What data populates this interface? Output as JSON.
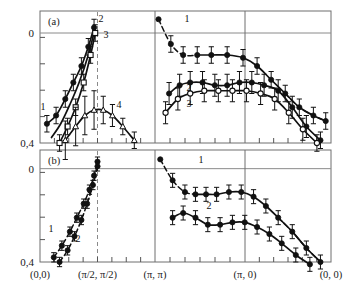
{
  "figure": {
    "panels": [
      {
        "tag": "(a)"
      },
      {
        "tag": "(b)"
      }
    ],
    "y_axis": {
      "top_label": "0",
      "bottom_label": "0,4",
      "range_top": 0,
      "range_bottom": -0.4,
      "minor_ticks": 4
    },
    "x_axis": {
      "tick_labels": [
        "(0,0)",
        "(π/2, π/2)",
        "(π, π)",
        "(π, 0)",
        "(0, 0)"
      ],
      "segment_dividers": [
        "(π, π)",
        "(π, 0)"
      ],
      "dashed_marker": "(π/2, π/2)"
    },
    "curve_labels_panel_a": [
      "1",
      "2",
      "3",
      "4",
      "1",
      "2",
      "3"
    ],
    "curve_labels_panel_b": [
      "1",
      "2",
      "1",
      "2"
    ]
  },
  "chart_data": {
    "type": "line",
    "title": "",
    "xlabel": "",
    "ylabel": "",
    "ylim": [
      -0.4,
      0.08
    ],
    "grid": false,
    "legend_position": "inline-curve-labels",
    "axis_notes": {
      "y_tick_labels": [
        "0",
        "0,4"
      ],
      "y_zero_gridline": true,
      "x_tick_labels": [
        "(0,0)",
        "(π/2, π/2)",
        "(π, π)",
        "(π, 0)",
        "(0, 0)"
      ],
      "x_panel_breaks_at": [
        "(π, π)",
        "(π, 0)"
      ],
      "vertical_dashed_line_at": "(π/2, π/2)"
    },
    "panel_a": {
      "tag": "(a)",
      "segment_1_nodal": {
        "x_label_from": "(0,0)",
        "x_label_to": "(π, π)",
        "series": [
          {
            "name": "1",
            "marker": "filled-circle",
            "line": "solid",
            "x": [
              0.06,
              0.14,
              0.22,
              0.29,
              0.36,
              0.42,
              0.47
            ],
            "y": [
              -0.33,
              -0.3,
              -0.24,
              -0.18,
              -0.12,
              -0.05,
              0.02
            ],
            "yerr": [
              0.03,
              0.03,
              0.03,
              0.03,
              0.03,
              0.03,
              0.03
            ]
          },
          {
            "name": "2",
            "marker": "none",
            "line": "solid",
            "x": [
              0.1,
              0.18,
              0.26,
              0.34,
              0.42,
              0.48
            ],
            "y": [
              -0.38,
              -0.33,
              -0.26,
              -0.18,
              -0.08,
              0.02
            ]
          },
          {
            "name": "3",
            "marker": "open-square",
            "line": "solid",
            "x": [
              0.17,
              0.24,
              0.31,
              0.38,
              0.44,
              0.48
            ],
            "y": [
              -0.4,
              -0.34,
              -0.27,
              -0.18,
              -0.08,
              0.0
            ],
            "yerr": [
              0.03,
              0.03,
              0.03,
              0.03,
              0.03,
              0.03
            ]
          },
          {
            "name": "4",
            "marker": "open-triangle",
            "line": "solid",
            "x": [
              0.22,
              0.31,
              0.39,
              0.47,
              0.55,
              0.63,
              0.72,
              0.82
            ],
            "y": [
              -0.39,
              -0.34,
              -0.3,
              -0.28,
              -0.28,
              -0.3,
              -0.34,
              -0.39
            ],
            "yerr": [
              0.07,
              0.07,
              0.07,
              0.07,
              0.05,
              0.04,
              0.03,
              0.03
            ]
          }
        ]
      },
      "segment_2_antinodal": {
        "x_label_from": "(π, π)",
        "x_label_to": "(0, 0)",
        "series": [
          {
            "name": "1",
            "marker": "filled-circle",
            "line": "dashed-then-solid",
            "x": [
              0.02,
              0.09,
              0.16,
              0.24,
              0.32,
              0.41,
              0.5,
              0.58,
              0.66,
              0.74,
              0.82,
              0.9,
              0.97
            ],
            "y": [
              0.05,
              -0.04,
              -0.08,
              -0.08,
              -0.08,
              -0.08,
              -0.09,
              -0.12,
              -0.17,
              -0.22,
              -0.27,
              -0.3,
              -0.32
            ],
            "yerr": [
              0.0,
              0.03,
              0.03,
              0.03,
              0.03,
              0.03,
              0.03,
              0.03,
              0.03,
              0.03,
              0.03,
              0.03,
              0.03
            ]
          },
          {
            "name": "2",
            "marker": "filled-circle",
            "line": "solid",
            "x": [
              0.08,
              0.14,
              0.2,
              0.27,
              0.34,
              0.41,
              0.48,
              0.55,
              0.62,
              0.7,
              0.78,
              0.86,
              0.94
            ],
            "y": [
              -0.22,
              -0.19,
              -0.18,
              -0.18,
              -0.19,
              -0.19,
              -0.18,
              -0.18,
              -0.19,
              -0.21,
              -0.27,
              -0.34,
              -0.39
            ],
            "yerr": [
              0.04,
              0.04,
              0.04,
              0.04,
              0.04,
              0.04,
              0.04,
              0.04,
              0.04,
              0.04,
              0.04,
              0.04,
              0.03
            ]
          },
          {
            "name": "3",
            "marker": "open-circle",
            "line": "solid",
            "x": [
              0.06,
              0.13,
              0.2,
              0.28,
              0.36,
              0.44,
              0.52,
              0.6,
              0.68,
              0.76,
              0.84,
              0.92
            ],
            "y": [
              -0.29,
              -0.24,
              -0.22,
              -0.21,
              -0.21,
              -0.21,
              -0.21,
              -0.22,
              -0.24,
              -0.29,
              -0.35,
              -0.4
            ],
            "yerr": [
              0.04,
              0.04,
              0.04,
              0.04,
              0.04,
              0.04,
              0.04,
              0.04,
              0.04,
              0.04,
              0.04,
              0.03
            ]
          }
        ]
      }
    },
    "panel_b": {
      "tag": "(b)",
      "segment_1_nodal": {
        "x_label_from": "(0,0)",
        "x_label_to": "(π, π)",
        "series": [
          {
            "name": "1",
            "marker": "filled-circle",
            "line": "dashed",
            "x": [
              0.12,
              0.19,
              0.26,
              0.32,
              0.38,
              0.43,
              0.47,
              0.5
            ],
            "y": [
              -0.38,
              -0.33,
              -0.27,
              -0.21,
              -0.15,
              -0.09,
              -0.03,
              0.03
            ],
            "yerr": [
              0.02,
              0.02,
              0.02,
              0.02,
              0.02,
              0.02,
              0.02,
              0.02
            ]
          },
          {
            "name": "2",
            "marker": "filled-circle",
            "line": "dashed",
            "x": [
              0.17,
              0.24,
              0.3,
              0.36,
              0.41,
              0.46,
              0.5
            ],
            "y": [
              -0.4,
              -0.35,
              -0.29,
              -0.22,
              -0.15,
              -0.07,
              0.01
            ],
            "yerr": [
              0.02,
              0.02,
              0.02,
              0.02,
              0.02,
              0.02,
              0.02
            ]
          }
        ]
      },
      "segment_2_antinodal": {
        "x_label_from": "(π, π)",
        "x_label_to": "(0, 0)",
        "series": [
          {
            "name": "1",
            "marker": "filled-circle",
            "line": "dashed-then-solid",
            "x": [
              0.03,
              0.1,
              0.17,
              0.23,
              0.29,
              0.35,
              0.42,
              0.49,
              0.56,
              0.63,
              0.7,
              0.78,
              0.86,
              0.94
            ],
            "y": [
              0.04,
              -0.05,
              -0.1,
              -0.11,
              -0.11,
              -0.11,
              -0.1,
              -0.1,
              -0.12,
              -0.16,
              -0.21,
              -0.27,
              -0.34,
              -0.4
            ],
            "yerr": [
              0.0,
              0.03,
              0.03,
              0.03,
              0.03,
              0.03,
              0.03,
              0.03,
              0.03,
              0.03,
              0.03,
              0.03,
              0.03,
              0.03
            ]
          },
          {
            "name": "2",
            "marker": "filled-circle",
            "line": "solid",
            "x": [
              0.1,
              0.16,
              0.23,
              0.3,
              0.37,
              0.44,
              0.51,
              0.58,
              0.65,
              0.72,
              0.8,
              0.88
            ],
            "y": [
              -0.21,
              -0.19,
              -0.21,
              -0.24,
              -0.24,
              -0.23,
              -0.23,
              -0.25,
              -0.28,
              -0.32,
              -0.37,
              -0.41
            ],
            "yerr": [
              0.03,
              0.03,
              0.03,
              0.03,
              0.03,
              0.03,
              0.03,
              0.03,
              0.03,
              0.03,
              0.03,
              0.03
            ]
          }
        ]
      }
    }
  }
}
